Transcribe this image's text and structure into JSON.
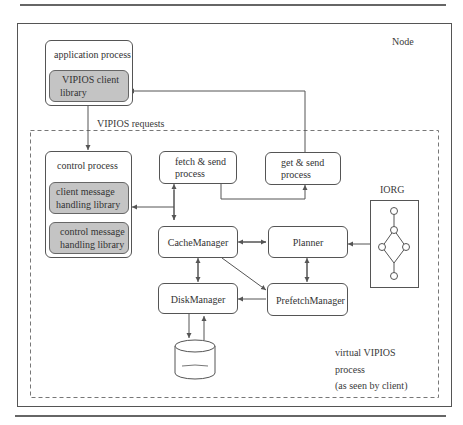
{
  "diagram": {
    "node_label": "Node",
    "requests_label": "VIPIOS requests",
    "application_process": {
      "title": "application process",
      "library": [
        "VIPIOS client",
        "library"
      ]
    },
    "control_process": {
      "title": "control process",
      "libraries": [
        [
          "client message",
          "handling library"
        ],
        [
          "control message",
          "handling library"
        ]
      ]
    },
    "fetch_send": [
      "fetch & send",
      "process"
    ],
    "get_send": [
      "get & send",
      "process"
    ],
    "cache_manager": "CacheManager",
    "planner": "Planner",
    "disk_manager": "DiskManager",
    "prefetch_manager": "PrefetchManager",
    "iorg_label": "IORG",
    "virtual_label": [
      "virtual VIPIOS",
      "process",
      "(as seen by client)"
    ],
    "colors": {
      "library_fill": "#c4c4c4",
      "stroke": "#555555",
      "background": "#ffffff"
    }
  }
}
